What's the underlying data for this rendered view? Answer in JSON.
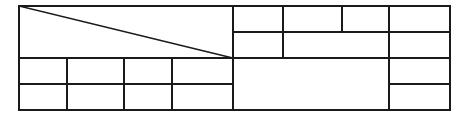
{
  "document": {
    "title": "Wireframe Line Diagram",
    "type": "line-drawing",
    "width": 464,
    "height": 119,
    "background_color": "#ffffff",
    "stroke_color": "#1a1a1a",
    "stroke_width": 1.6,
    "text_content": "",
    "labels": []
  },
  "canvas": {
    "frame": {
      "name": "outer-frame",
      "x": 19,
      "y": 6,
      "width": 431,
      "height": 104,
      "right": 450,
      "bottom": 110
    },
    "main_divider_x": 233
  },
  "left_region": {
    "name": "left-region",
    "x": 19,
    "y": 6,
    "right": 233,
    "bottom": 110,
    "upper_panel": {
      "name": "left-upper-panel",
      "x": 19,
      "y": 6,
      "right": 233,
      "bottom": 58,
      "diagonal": {
        "name": "diagonal-line",
        "x1": 19,
        "y1": 6,
        "x2": 233,
        "y2": 58
      }
    },
    "lower_grid": {
      "name": "left-lower-grid",
      "x": 19,
      "y": 58,
      "right": 233,
      "bottom": 110,
      "columns": 4,
      "rows": 2,
      "column_dividers_x": [
        67,
        124,
        172
      ],
      "row_divider_y": [
        84
      ]
    }
  },
  "right_region": {
    "name": "right-region",
    "x": 233,
    "y": 6,
    "right": 450,
    "bottom": 110,
    "top_band": {
      "name": "right-top-band",
      "y": 6,
      "bottom": 32,
      "column_dividers_x": [
        283,
        342,
        389
      ],
      "cells": 4
    },
    "middle_band": {
      "name": "right-middle-band",
      "y": 32,
      "bottom": 58,
      "column_dividers_x": [
        283,
        389
      ],
      "cells": 3
    },
    "bottom_band": {
      "name": "right-bottom-band",
      "y": 58,
      "bottom": 110,
      "main_cell": {
        "name": "right-bottom-main-cell",
        "x": 233,
        "y": 58,
        "right": 389,
        "bottom": 110
      },
      "far_column": {
        "name": "far-right-column",
        "x": 389,
        "right": 450,
        "row_divider_y": [
          84
        ],
        "rows": 2
      }
    }
  },
  "horizontal_lines": [
    {
      "name": "line-top-edge",
      "x1": 19,
      "y": 6,
      "x2": 450
    },
    {
      "name": "line-right-top-split",
      "x1": 233,
      "y": 32,
      "x2": 450
    },
    {
      "name": "line-mid-split",
      "x1": 19,
      "y": 58,
      "x2": 450
    },
    {
      "name": "line-left-row-split",
      "x1": 19,
      "y": 84,
      "x2": 233
    },
    {
      "name": "line-far-row-split",
      "x1": 389,
      "y": 84,
      "x2": 450
    },
    {
      "name": "line-bottom-edge",
      "x1": 19,
      "y": 110,
      "x2": 450
    }
  ],
  "vertical_lines": [
    {
      "name": "line-left-edge",
      "x": 19,
      "y1": 6,
      "y2": 110
    },
    {
      "name": "line-left-col-1",
      "x": 67,
      "y1": 58,
      "y2": 110
    },
    {
      "name": "line-left-col-2",
      "x": 124,
      "y1": 58,
      "y2": 110
    },
    {
      "name": "line-left-col-3",
      "x": 172,
      "y1": 58,
      "y2": 110
    },
    {
      "name": "line-main-divider",
      "x": 233,
      "y1": 6,
      "y2": 110
    },
    {
      "name": "line-right-col-1",
      "x": 283,
      "y1": 6,
      "y2": 58
    },
    {
      "name": "line-right-col-2",
      "x": 342,
      "y1": 6,
      "y2": 32
    },
    {
      "name": "line-right-col-3",
      "x": 389,
      "y1": 6,
      "y2": 110
    },
    {
      "name": "line-right-edge",
      "x": 450,
      "y1": 6,
      "y2": 110
    }
  ],
  "cells": [
    {
      "name": "cell-left-upper",
      "x": 19,
      "y": 6,
      "w": 214,
      "h": 52
    },
    {
      "name": "cell-left-r1c1",
      "x": 19,
      "y": 58,
      "w": 48,
      "h": 26
    },
    {
      "name": "cell-left-r1c2",
      "x": 67,
      "y": 58,
      "w": 57,
      "h": 26
    },
    {
      "name": "cell-left-r1c3",
      "x": 124,
      "y": 58,
      "w": 48,
      "h": 26
    },
    {
      "name": "cell-left-r1c4",
      "x": 172,
      "y": 58,
      "w": 61,
      "h": 26
    },
    {
      "name": "cell-left-r2c1",
      "x": 19,
      "y": 84,
      "w": 48,
      "h": 26
    },
    {
      "name": "cell-left-r2c2",
      "x": 67,
      "y": 84,
      "w": 57,
      "h": 26
    },
    {
      "name": "cell-left-r2c3",
      "x": 124,
      "y": 84,
      "w": 48,
      "h": 26
    },
    {
      "name": "cell-left-r2c4",
      "x": 172,
      "y": 84,
      "w": 61,
      "h": 26
    },
    {
      "name": "cell-right-top-1",
      "x": 233,
      "y": 6,
      "w": 50,
      "h": 26
    },
    {
      "name": "cell-right-top-2",
      "x": 283,
      "y": 6,
      "w": 59,
      "h": 26
    },
    {
      "name": "cell-right-top-3",
      "x": 342,
      "y": 6,
      "w": 47,
      "h": 26
    },
    {
      "name": "cell-right-top-4",
      "x": 389,
      "y": 6,
      "w": 61,
      "h": 26
    },
    {
      "name": "cell-right-mid-1",
      "x": 233,
      "y": 32,
      "w": 50,
      "h": 26
    },
    {
      "name": "cell-right-mid-2",
      "x": 283,
      "y": 32,
      "w": 106,
      "h": 26
    },
    {
      "name": "cell-right-mid-3",
      "x": 389,
      "y": 32,
      "w": 61,
      "h": 26
    },
    {
      "name": "cell-right-bottom-main",
      "x": 233,
      "y": 58,
      "w": 156,
      "h": 52
    },
    {
      "name": "cell-far-right-upper",
      "x": 389,
      "y": 58,
      "w": 61,
      "h": 26
    },
    {
      "name": "cell-far-right-lower",
      "x": 389,
      "y": 84,
      "w": 61,
      "h": 26
    }
  ]
}
